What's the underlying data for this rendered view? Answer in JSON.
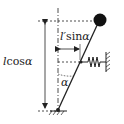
{
  "diagram": {
    "labels": {
      "vertical_length": "lcosα",
      "vertical_length_l": "l",
      "vertical_length_fn": "cos",
      "vertical_length_var": "α",
      "horizontal_offset_l": "l′",
      "horizontal_offset_fn": "sin",
      "horizontal_offset_var": "α",
      "angle": "α"
    },
    "colors": {
      "stroke": "#222222",
      "ball": "#111111",
      "background": "#ffffff"
    },
    "elements": [
      "pendulum-rod",
      "ball",
      "pivot",
      "spring",
      "wall",
      "ground",
      "vertical-reference-line",
      "dimension-arrows",
      "angle-arc"
    ]
  }
}
